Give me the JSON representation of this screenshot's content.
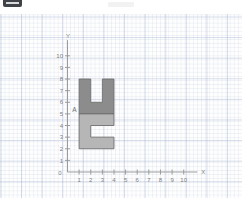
{
  "header": {
    "badge_name": "menu-badge",
    "badge_color": "#3f4246"
  },
  "chart_data": {
    "type": "scatter",
    "title": "",
    "xlabel": "X",
    "ylabel": "Y",
    "xlim": [
      0,
      11
    ],
    "ylim": [
      0,
      11
    ],
    "grid": true,
    "legend": "none",
    "x_ticks": [
      "0",
      "1",
      "2",
      "3",
      "4",
      "5",
      "6",
      "7",
      "8",
      "9",
      "10"
    ],
    "y_ticks": [
      "0",
      "1",
      "2",
      "3",
      "4",
      "5",
      "6",
      "7",
      "8",
      "9",
      "10"
    ],
    "annotations": [
      {
        "label": "A",
        "x": 1,
        "y": 5
      }
    ],
    "shapes": [
      {
        "name": "upper-u-shape",
        "fill": "#8c8c8c",
        "stroke": "#6f6f6f",
        "points": [
          [
            1,
            5
          ],
          [
            1,
            8
          ],
          [
            2,
            8
          ],
          [
            2,
            6
          ],
          [
            3,
            6
          ],
          [
            3,
            8
          ],
          [
            4,
            8
          ],
          [
            4,
            5
          ]
        ]
      },
      {
        "name": "lower-c-shape",
        "fill": "#b6b6b6",
        "stroke": "#6f6f6f",
        "points": [
          [
            1,
            5
          ],
          [
            4,
            5
          ],
          [
            4,
            4
          ],
          [
            2,
            4
          ],
          [
            2,
            3
          ],
          [
            4,
            3
          ],
          [
            4,
            2
          ],
          [
            1,
            2
          ]
        ]
      }
    ]
  }
}
